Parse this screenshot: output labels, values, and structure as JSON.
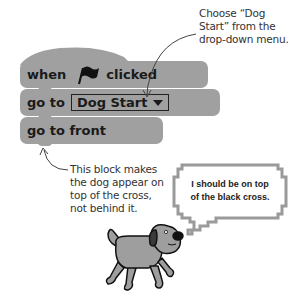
{
  "callouts": {
    "dropdown_tip": [
      "Choose “Dog",
      "Start” from the",
      "drop-down menu."
    ],
    "front_tip": [
      "This block makes",
      "the dog appear on",
      "top of the cross,",
      "not behind it."
    ]
  },
  "blocks": {
    "hat": {
      "word1": "when",
      "icon": "green-flag-icon",
      "word2": "clicked"
    },
    "goto": {
      "label": "go to",
      "dropdown_value": "Dog Start"
    },
    "front": {
      "label": "go to front"
    }
  },
  "speech_bubble": {
    "lines": [
      "I should be on top",
      "of the black cross."
    ]
  },
  "colors": {
    "block": "#a0a0a0",
    "text": "#1a1a1a",
    "bubble_border": "#9a9a9a"
  }
}
